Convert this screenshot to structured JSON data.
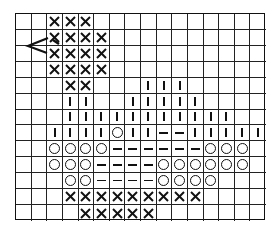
{
  "chart_title": "",
  "grid": {
    "columns": 16,
    "rows": 13,
    "legend_symbols": {
      "X": "cross-stitch",
      "O": "circle",
      "I": "vertical-bar",
      "-": "horizontal-dash",
      ".": "empty"
    },
    "pattern": [
      "..XXX...........",
      "..XXXX..........",
      "..XXXX..........",
      "..XXXX..........",
      "...XX...III.....",
      "...II..IIIII....",
      "...IIIIIIIIIII..",
      "..IIIIOII--IIIII",
      "..OOOO------OOO.",
      "..OOO----OOOOOO.",
      "...OO----OOOO...",
      "...XXXXXXXXX....",
      "....XXXXX......."
    ]
  },
  "annotation": {
    "arrow_marker": "start-arrow",
    "row": 3,
    "points_to_col": 3
  },
  "colors": {
    "line": "#111111",
    "background": "#ffffff"
  }
}
